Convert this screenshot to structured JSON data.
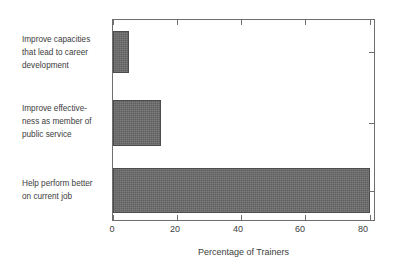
{
  "chart_data": {
    "type": "bar",
    "orientation": "horizontal",
    "title": "",
    "xlabel": "Percentage of Trainers",
    "ylabel": "",
    "categories": [
      "Improve capacities that lead to career development",
      "Improve effectiveness as member of public service",
      "Help perform better on current job"
    ],
    "category_lines": [
      [
        "Improve capacities",
        "that lead to career",
        "development"
      ],
      [
        "Improve effective-",
        "ness as member of",
        "public service"
      ],
      [
        "Help perform better",
        "on current job"
      ]
    ],
    "values": [
      5,
      15,
      80
    ],
    "xlim": [
      0,
      82
    ],
    "xticks": [
      0,
      20,
      40,
      60,
      80
    ],
    "xtick_labels": [
      "0",
      "20",
      "40",
      "60",
      "80"
    ],
    "grid": false,
    "legend": null,
    "bar_color": "#6b6b6b",
    "bar_edge_color": "#4c4c4c",
    "axis_color": "#6e6e6e",
    "text_color": "#3d3d3d",
    "background": "#ffffff"
  }
}
